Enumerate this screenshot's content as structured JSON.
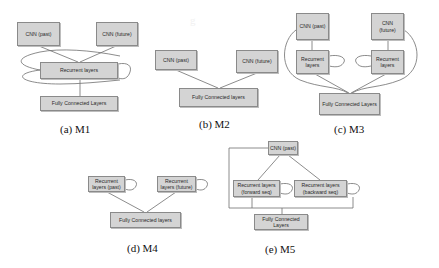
{
  "figure": {
    "panels": [
      {
        "id": "m1",
        "caption": "(a) M1",
        "nodes": {
          "cnn_past": "CNN (past)",
          "cnn_future": "CNN (future)",
          "recurrent": "Recurrent layers",
          "fc": "Fully Connected Layers"
        }
      },
      {
        "id": "m2",
        "caption": "(b) M2",
        "nodes": {
          "cnn_past": "CNN (past)",
          "cnn_future": "CNN (future)",
          "fc": "Fully Connected layers"
        }
      },
      {
        "id": "m3",
        "caption": "(c) M3",
        "nodes": {
          "cnn_past": "CNN (past)",
          "cnn_future": "CNN (future)",
          "recurrent_left": "Recurrent layers",
          "recurrent_right": "Recurrent layers",
          "fc": "Fully Connected Layers"
        }
      },
      {
        "id": "m4",
        "caption": "(d) M4",
        "nodes": {
          "recurrent_past": "Recurrent layers (past)",
          "recurrent_future": "Recurrent layers (future)",
          "fc": "Fully Connected layers"
        }
      },
      {
        "id": "m5",
        "caption": "(e) M5",
        "nodes": {
          "cnn_past": "CNN (past)",
          "recurrent_forward": "Recurrent layers (forward seq)",
          "recurrent_backward": "Recurrent layers (backward seq)",
          "fc": "Fully Connected Layers"
        }
      }
    ]
  }
}
